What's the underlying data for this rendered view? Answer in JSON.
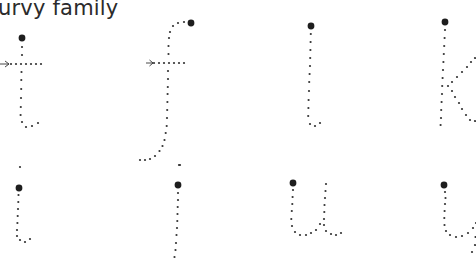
{
  "worksheet": {
    "title": "urvy family",
    "letters_row1": [
      {
        "letter": "t",
        "has_crossbar_arrow": true
      },
      {
        "letter": "f",
        "has_crossbar_arrow": true
      },
      {
        "letter": "l",
        "has_crossbar_arrow": false
      },
      {
        "letter": "k",
        "has_crossbar_arrow": false
      }
    ],
    "letters_row2": [
      {
        "letter": "i"
      },
      {
        "letter": "j"
      },
      {
        "letter": "u"
      },
      {
        "letter": "y"
      }
    ],
    "colors": {
      "dots": "#333333",
      "start_dot": "#1e1e1e",
      "text": "#2b2b2b",
      "background": "#ffffff"
    }
  }
}
